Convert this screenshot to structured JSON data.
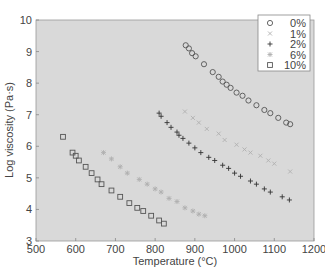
{
  "chart_data": {
    "type": "scatter",
    "title": "",
    "xlabel": "Temperature (°C)",
    "ylabel": "Log viscosity (Pa·s)",
    "xlim": [
      500,
      1200
    ],
    "ylim": [
      3,
      10
    ],
    "xticks": [
      500,
      600,
      700,
      800,
      900,
      1000,
      1100,
      1200
    ],
    "yticks": [
      3,
      4,
      5,
      6,
      7,
      8,
      9,
      10
    ],
    "grid": false,
    "legend_position": "upper right",
    "background": "#d9d9d9",
    "series": [
      {
        "name": "0%",
        "marker": "circle",
        "color": "#555555",
        "x": [
          877,
          885,
          893,
          902,
          923,
          945,
          960,
          970,
          980,
          990,
          1005,
          1020,
          1035,
          1055,
          1075,
          1090,
          1110,
          1130,
          1140
        ],
        "y": [
          9.2,
          9.1,
          8.95,
          8.85,
          8.6,
          8.35,
          8.2,
          8.05,
          7.95,
          7.85,
          7.7,
          7.6,
          7.45,
          7.3,
          7.15,
          7.05,
          6.9,
          6.75,
          6.7
        ]
      },
      {
        "name": "1%",
        "marker": "x",
        "color": "#b0b0b0",
        "x": [
          875,
          895,
          910,
          930,
          960,
          975,
          1005,
          1025,
          1040,
          1065,
          1085,
          1100,
          1140
        ],
        "y": [
          7.1,
          6.9,
          6.75,
          6.55,
          6.4,
          6.2,
          6.05,
          5.9,
          5.8,
          5.7,
          5.55,
          5.45,
          5.2
        ]
      },
      {
        "name": "2%",
        "marker": "plus",
        "color": "#333333",
        "x": [
          810,
          815,
          830,
          840,
          855,
          860,
          870,
          885,
          900,
          915,
          935,
          950,
          970,
          985,
          1000,
          1015,
          1040,
          1055,
          1075,
          1090,
          1120,
          1138
        ],
        "y": [
          7.05,
          6.95,
          6.75,
          6.6,
          6.45,
          6.35,
          6.25,
          6.1,
          5.95,
          5.8,
          5.65,
          5.55,
          5.4,
          5.3,
          5.15,
          5.05,
          4.9,
          4.8,
          4.65,
          4.55,
          4.4,
          4.3
        ]
      },
      {
        "name": "6%",
        "marker": "star",
        "color": "#b0b0b0",
        "x": [
          670,
          690,
          712,
          730,
          760,
          780,
          800,
          815,
          835,
          855,
          875,
          895,
          910,
          925
        ],
        "y": [
          5.8,
          5.6,
          5.35,
          5.15,
          4.95,
          4.8,
          4.65,
          4.55,
          4.35,
          4.25,
          4.05,
          3.95,
          3.85,
          3.8
        ]
      },
      {
        "name": "10%",
        "marker": "square",
        "color": "#555555",
        "x": [
          568,
          592,
          600,
          608,
          625,
          640,
          655,
          665,
          690,
          712,
          735,
          755,
          770,
          790,
          810,
          822
        ],
        "y": [
          6.3,
          5.8,
          5.7,
          5.55,
          5.35,
          5.15,
          4.95,
          4.8,
          4.6,
          4.4,
          4.2,
          4.05,
          3.95,
          3.8,
          3.65,
          3.55
        ]
      }
    ]
  }
}
